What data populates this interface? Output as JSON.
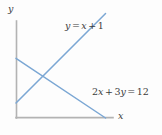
{
  "figure": {
    "type": "line-graph",
    "background_color": "#fdfdfd",
    "axis_color": "#b3b3b3",
    "line_color": "#7ba7d4",
    "text_color": "#3c3c3c",
    "axes": {
      "x_label": "x",
      "y_label": "y"
    },
    "labels": {
      "line1": {
        "lhs": "y",
        "eq": "=",
        "var": "x",
        "plus": "+",
        "const": "1",
        "full": "y = x + 1"
      },
      "line2": {
        "coef1": "2",
        "var1": "x",
        "plus": "+",
        "coef2": "3",
        "var2": "y",
        "eq": "=",
        "rhs": "12",
        "full": "2x + 3y = 12"
      }
    }
  },
  "chart_data": {
    "type": "line",
    "title": "",
    "xlabel": "x",
    "ylabel": "y",
    "grid": false,
    "legend": "inline-annotations",
    "xlim": [
      0,
      6.5
    ],
    "ylim": [
      0,
      6.5
    ],
    "series": [
      {
        "name": "2x + 3y = 12",
        "equation": "2x + 3y = 12",
        "slope": -0.6666666667,
        "intercept": 4,
        "x": [
          0,
          6
        ],
        "y": [
          4,
          0
        ],
        "color": "#7ba7d4",
        "label_position": "lower-right"
      },
      {
        "name": "y = x + 1",
        "equation": "y = x + 1",
        "slope": 1,
        "intercept": 1,
        "x": [
          0,
          6
        ],
        "y": [
          1,
          7
        ],
        "color": "#7ba7d4",
        "label_position": "upper-right"
      }
    ],
    "intersection": {
      "x": 1.8,
      "y": 2.8
    }
  }
}
